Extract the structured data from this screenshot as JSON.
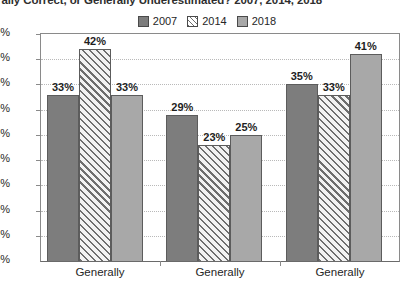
{
  "chart_data": {
    "type": "bar",
    "title": "rally Correct, or Generally Underestimated? 2007, 2014, 2018",
    "xlabel": "",
    "ylabel": "",
    "ylim": [
      0,
      45
    ],
    "grid": true,
    "legend_position": "top-center",
    "categories": [
      "Generally",
      "Generally",
      "Generally"
    ],
    "ytick_labels": [
      "45%",
      "40%",
      "35%",
      "30%",
      "25%",
      "20%",
      "15%",
      "10%",
      "5%",
      "0%"
    ],
    "ytick_values": [
      45,
      40,
      35,
      30,
      25,
      20,
      15,
      10,
      5,
      0
    ],
    "series": [
      {
        "name": "2007",
        "color": "#7d7d7d",
        "pattern": "solid",
        "values": [
          33,
          29,
          35
        ],
        "labels": [
          "33%",
          "29%",
          "35%"
        ]
      },
      {
        "name": "2014",
        "color": "#ffffff",
        "pattern": "diagonal-hatch",
        "values": [
          42,
          23,
          33
        ],
        "labels": [
          "42%",
          "23%",
          "33%"
        ]
      },
      {
        "name": "2018",
        "color": "#a8a8a8",
        "pattern": "solid",
        "values": [
          33,
          25,
          41
        ],
        "labels": [
          "33%",
          "25%",
          "41%"
        ]
      }
    ]
  }
}
